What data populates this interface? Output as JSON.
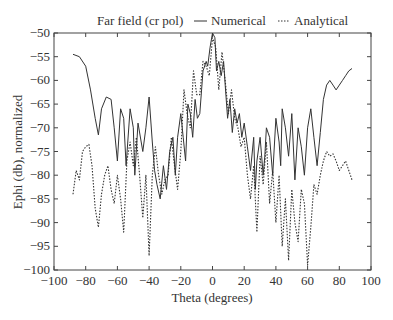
{
  "chart_data": {
    "type": "line",
    "title": "Far field (cr pol)",
    "xlabel": "Theta (degrees)",
    "ylabel": "Ephi (db), normalized",
    "xlim": [
      -100,
      100
    ],
    "ylim": [
      -100,
      -50
    ],
    "xticks": [
      -100,
      -80,
      -60,
      -40,
      -20,
      0,
      20,
      40,
      60,
      80,
      100
    ],
    "yticks": [
      -50,
      -55,
      -60,
      -65,
      -70,
      -75,
      -80,
      -85,
      -90,
      -95,
      -100
    ],
    "grid": false,
    "legend_position": "top",
    "series": [
      {
        "name": "Numerical",
        "style": "solid",
        "color": "#333333",
        "x": [
          -88,
          -84,
          -80,
          -77,
          -74,
          -72,
          -70,
          -67,
          -64,
          -62,
          -60,
          -58,
          -56,
          -54.5,
          -52,
          -50,
          -49,
          -47,
          -45,
          -44,
          -42,
          -40,
          -38,
          -36.5,
          -35,
          -33,
          -31,
          -29,
          -27,
          -25,
          -23.5,
          -22,
          -20,
          -18.5,
          -17,
          -15.5,
          -14,
          -12.5,
          -11,
          -9.5,
          -8,
          -6,
          -4,
          -3,
          -1.5,
          0,
          1.5,
          2.5,
          4,
          5.5,
          7,
          8,
          9.5,
          11,
          12.5,
          14,
          15.5,
          17,
          18.5,
          20,
          22,
          24,
          26,
          27,
          28,
          30,
          32,
          33,
          34,
          36,
          38,
          40,
          42,
          43,
          44,
          46,
          48,
          50,
          52,
          54,
          56,
          58,
          60,
          62,
          64,
          66,
          68,
          70,
          72,
          74,
          76,
          78,
          80,
          82,
          84,
          86,
          88
        ],
        "y": [
          -54.5,
          -55,
          -57,
          -62,
          -68,
          -71.5,
          -66,
          -63.5,
          -64,
          -70,
          -77,
          -66,
          -68,
          -78,
          -66,
          -70,
          -80,
          -69,
          -73,
          -75,
          -70,
          -63.5,
          -73,
          -79,
          -82,
          -85,
          -78,
          -83,
          -75,
          -72,
          -80,
          -72,
          -67,
          -72,
          -77,
          -65,
          -67,
          -72,
          -64,
          -68,
          -67,
          -58,
          -56,
          -57,
          -53,
          -50,
          -51,
          -58,
          -56,
          -59,
          -56,
          -61,
          -68,
          -64,
          -71,
          -66,
          -69,
          -67,
          -72,
          -69,
          -74,
          -79,
          -72,
          -83,
          -77,
          -72,
          -80,
          -76,
          -70,
          -72,
          -80,
          -68,
          -73,
          -78,
          -66,
          -70,
          -76,
          -67,
          -81,
          -70,
          -74,
          -80,
          -70,
          -66,
          -72,
          -78,
          -71,
          -64,
          -61,
          -60,
          -61,
          -62,
          -61,
          -60,
          -59,
          -58,
          -57.5
        ]
      },
      {
        "name": "Analytical",
        "style": "dotted",
        "color": "#333333",
        "x": [
          -88,
          -86,
          -84,
          -82,
          -80,
          -78,
          -76,
          -74,
          -72,
          -70,
          -68,
          -66,
          -64,
          -62,
          -60,
          -58,
          -56,
          -54,
          -52,
          -50,
          -48,
          -46,
          -44,
          -42,
          -40,
          -38,
          -36,
          -34,
          -32,
          -30,
          -28,
          -26,
          -24,
          -22,
          -20,
          -18,
          -16,
          -14,
          -12,
          -10,
          -8,
          -6,
          -4,
          -2,
          0,
          2,
          4,
          6,
          8,
          10,
          12,
          14,
          16,
          18,
          20,
          22,
          24,
          26,
          28,
          30,
          32,
          34,
          36,
          38,
          40,
          42,
          44,
          46,
          48,
          50,
          52,
          54,
          56,
          58,
          60,
          62,
          64,
          66,
          68,
          70,
          72,
          74,
          76,
          78,
          80,
          82,
          84,
          86,
          88
        ],
        "y": [
          -84,
          -79,
          -81,
          -75,
          -74,
          -73.5,
          -78,
          -87,
          -91,
          -84,
          -80,
          -78,
          -83,
          -86,
          -80,
          -85,
          -92,
          -77,
          -73,
          -78,
          -72,
          -80,
          -89,
          -80,
          -97,
          -80,
          -74,
          -80,
          -84,
          -81,
          -80,
          -72,
          -78,
          -83,
          -75,
          -62,
          -67,
          -70,
          -58,
          -63,
          -63,
          -56,
          -57,
          -59,
          -51,
          -53,
          -62,
          -54,
          -60,
          -67,
          -62,
          -68,
          -70,
          -74,
          -72,
          -80,
          -85,
          -78,
          -92,
          -76,
          -82,
          -73,
          -86,
          -79,
          -90,
          -80,
          -95,
          -85,
          -98,
          -83,
          -90,
          -94,
          -83,
          -86,
          -99,
          -91,
          -82,
          -84,
          -80,
          -77,
          -75,
          -76,
          -75.5,
          -77,
          -79,
          -78,
          -77,
          -79,
          -81
        ]
      }
    ]
  },
  "legend": {
    "title": "Far field (cr pol)",
    "items": [
      {
        "label": "Numerical",
        "style": "solid"
      },
      {
        "label": "Analytical",
        "style": "dotted"
      }
    ]
  },
  "axes": {
    "xlabel": "Theta (degrees)",
    "ylabel": "Ephi (db), normalized"
  }
}
